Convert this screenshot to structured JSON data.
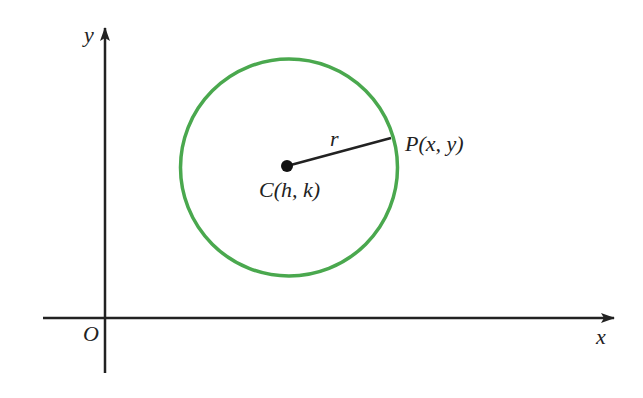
{
  "diagram": {
    "colors": {
      "circle": "#4aa84e",
      "axes": "#222222",
      "radius": "#222222",
      "center_point": "#111111",
      "text": "#222222",
      "background": "#ffffff"
    },
    "axes": {
      "x_label": "x",
      "y_label": "y",
      "origin_label": "O"
    },
    "circle": {
      "center_label": "C(h, k)",
      "point_label": "P(x, y)",
      "radius_label": "r"
    }
  }
}
